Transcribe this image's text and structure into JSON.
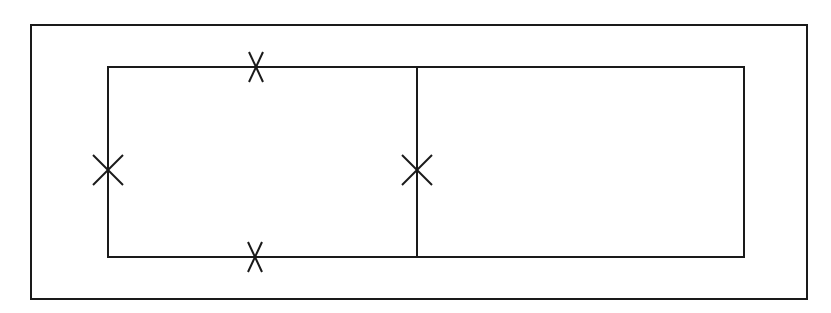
{
  "diagram": {
    "type": "geometric-line-drawing",
    "stroke_color": "#1a1a1a",
    "background": "#ffffff",
    "outer_rect": {
      "x": 31,
      "y": 25,
      "w": 776,
      "h": 274
    },
    "inner_rect": {
      "x": 108,
      "y": 67,
      "w": 636,
      "h": 190
    },
    "divider": {
      "x": 417,
      "y1": 67,
      "y2": 257
    },
    "tick_marks": [
      {
        "name": "top-edge-mark",
        "x": 256,
        "y": 67,
        "orientation": "vertical"
      },
      {
        "name": "left-edge-mark",
        "x": 108,
        "y": 170,
        "orientation": "horizontal"
      },
      {
        "name": "bottom-edge-mark",
        "x": 255,
        "y": 257,
        "orientation": "vertical"
      },
      {
        "name": "divider-mark",
        "x": 417,
        "y": 170,
        "orientation": "horizontal"
      }
    ]
  }
}
